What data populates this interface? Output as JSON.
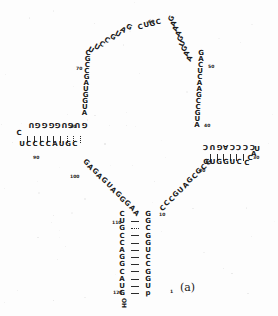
{
  "figure": {
    "panel_label": "(a)",
    "type": "rna-secondary-structure",
    "terminus_3prime": "OH",
    "terminus_5prime_number": "1"
  },
  "position_numbers": [
    {
      "label": "1",
      "x": 170,
      "y": 289,
      "rot": 0
    },
    {
      "label": "10",
      "x": 159,
      "y": 212,
      "rot": 0
    },
    {
      "label": "20",
      "x": 199,
      "y": 168,
      "rot": 0
    },
    {
      "label": "30",
      "x": 253,
      "y": 155,
      "rot": 0
    },
    {
      "label": "40",
      "x": 204,
      "y": 123,
      "rot": 0
    },
    {
      "label": "50",
      "x": 208,
      "y": 64,
      "rot": 0
    },
    {
      "label": "60",
      "x": 148,
      "y": 19,
      "rot": 0
    },
    {
      "label": "70",
      "x": 76,
      "y": 66,
      "rot": 0
    },
    {
      "label": "80",
      "x": 70,
      "y": 124,
      "rot": 0
    },
    {
      "label": "90",
      "x": 33,
      "y": 155,
      "rot": 0
    },
    {
      "label": "100",
      "x": 70,
      "y": 174,
      "rot": 0
    },
    {
      "label": "110",
      "x": 112,
      "y": 220,
      "rot": 0
    },
    {
      "label": "120",
      "x": 113,
      "y": 290,
      "rot": 0
    }
  ],
  "strands": [
    {
      "name": "bottom-stem-5prime",
      "description": "5' side of the closing helix, read downward on the right column",
      "letters": [
        "G",
        "G",
        "C",
        "G",
        "G",
        "U",
        "C",
        "C",
        "G",
        "G",
        "U",
        "p"
      ],
      "x": 148,
      "y": 215,
      "dx": 0,
      "dy": 7.2,
      "rot": 0
    },
    {
      "name": "bottom-stem-3prime",
      "description": "3' side of the closing helix, read downward on the left column",
      "letters": [
        "C",
        "U",
        "G",
        "C",
        "C",
        "A",
        "G",
        "G",
        "C",
        "A",
        "U",
        "G"
      ],
      "x": 122,
      "y": 215,
      "dx": 0,
      "dy": 7.2,
      "rot": 0
    },
    {
      "name": "junction-right-ascend",
      "description": "multiloop strand rising to the right from the closing helix",
      "letters": [
        "C",
        "C",
        "C",
        "G",
        "U",
        "A",
        "G",
        "C",
        "G",
        "C",
        "G"
      ],
      "x": 163,
      "y": 209,
      "dx": 4.6,
      "dy": -4.6,
      "rot": -45
    },
    {
      "name": "right-arm-5prime-up",
      "description": "right helix 5' side ascending vertically",
      "letters": [
        "A",
        "U",
        "G",
        "C",
        "C",
        "G",
        "A",
        "A",
        "C",
        "U",
        "C",
        "A",
        "G"
      ],
      "x": 197,
      "y": 126,
      "dx": 0.35,
      "dy": -6.0,
      "rot": 0
    },
    {
      "name": "top-arc-right",
      "description": "top loop right side descending from apex",
      "letters": [
        "A",
        "A",
        "G",
        "U",
        "G",
        "A",
        "A",
        "A",
        "G"
      ],
      "x": 190,
      "y": 59,
      "dx": -2.2,
      "dy": -5.0,
      "rot": -68
    },
    {
      "name": "top-arc-apex",
      "description": "apex nucleotides of the top loop",
      "letters": [
        "C",
        "G",
        "U",
        "C"
      ],
      "x": 158,
      "y": 23,
      "dx": -6.0,
      "dy": 1.5,
      "rot": -12
    },
    {
      "name": "top-arc-left",
      "description": "top loop left side descending toward the upper-left stem",
      "letters": [
        "G",
        "A",
        "U",
        "G",
        "C",
        "C",
        "U",
        "U"
      ],
      "x": 128,
      "y": 28,
      "dx": -5.3,
      "dy": 3.3,
      "rot": 28
    },
    {
      "name": "left-arm-descend",
      "description": "upper-left strand descending toward the left helix",
      "letters": [
        "C",
        "G",
        "C",
        "C",
        "G",
        "A",
        "U",
        "G",
        "G",
        "U",
        "A"
      ],
      "x": 88,
      "y": 54,
      "dx": -0.35,
      "dy": 6.0,
      "rot": 0
    },
    {
      "name": "left-helix-top",
      "description": "upper strand of the left hairpin, drawn rotated 180 degrees",
      "letters": [
        "G",
        "U",
        "G",
        "U",
        "G",
        "G",
        "G",
        "G",
        "U"
      ],
      "x": 84,
      "y": 124,
      "dx": -6.6,
      "dy": 0,
      "rot": 180
    },
    {
      "name": "left-helix-loop",
      "description": "left hairpin terminal loop",
      "letters": [
        "C"
      ],
      "x": 19,
      "y": 134,
      "dx": 0,
      "dy": 0,
      "rot": 0
    },
    {
      "name": "left-helix-bottom",
      "description": "lower strand of the left hairpin",
      "letters": [
        "U",
        "C",
        "C",
        "C",
        "C",
        "A",
        "U",
        "G",
        "C"
      ],
      "x": 22,
      "y": 145,
      "dx": 6.6,
      "dy": 0,
      "rot": 0
    },
    {
      "name": "junction-left-descend",
      "description": "multiloop strand descending left-to-right back to the closing helix",
      "letters": [
        "G",
        "A",
        "G",
        "A",
        "G",
        "U",
        "A",
        "G",
        "G",
        "G",
        "A",
        "A"
      ],
      "x": 85,
      "y": 163,
      "dx": 4.6,
      "dy": 4.6,
      "rot": 45
    },
    {
      "name": "right-helix-top",
      "description": "upper strand of the right hairpin, drawn rotated 180 degrees",
      "letters": [
        "C",
        "C",
        "C",
        "C",
        "A",
        "G",
        "U",
        "C"
      ],
      "x": 252,
      "y": 146,
      "dx": -6.6,
      "dy": 0,
      "rot": 180
    },
    {
      "name": "right-helix-loop",
      "description": "right hairpin terminal loop",
      "letters": [
        "U",
        "A",
        "C",
        "C"
      ],
      "x": 257,
      "y": 150,
      "dx": -3.4,
      "dy": 4.6,
      "rot": 0
    },
    {
      "name": "right-helix-bottom",
      "description": "lower strand of the right hairpin",
      "letters": [
        "G",
        "U",
        "G",
        "G",
        "U",
        "C"
      ],
      "x": 206,
      "y": 163,
      "dx": 6.6,
      "dy": 0,
      "rot": 0
    }
  ],
  "base_pairs": [
    {
      "name": "left-helix-pairs",
      "orientation": "vertical",
      "x": 27,
      "y": 136,
      "step": 6.6,
      "count": 9,
      "styles": [
        "solid",
        "solid",
        "solid",
        "solid",
        "solid",
        "solid",
        "dotted",
        "dotted",
        "dotted"
      ]
    },
    {
      "name": "right-helix-pairs",
      "orientation": "vertical",
      "x": 210,
      "y": 154,
      "step": 6.6,
      "count": 6,
      "styles": [
        "solid",
        "solid",
        "solid",
        "solid",
        "solid",
        "solid"
      ]
    },
    {
      "name": "bottom-helix-pairs",
      "orientation": "horizontal",
      "x": 131,
      "y": 221,
      "step": 7.2,
      "count": 11,
      "styles": [
        "solid",
        "dotted",
        "solid",
        "solid",
        "solid",
        "solid",
        "solid",
        "solid",
        "solid",
        "solid",
        "solid"
      ]
    }
  ]
}
